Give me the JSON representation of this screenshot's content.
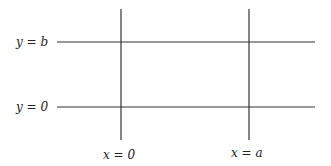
{
  "diagram": {
    "type": "grid-lines",
    "horizontal_lines": [
      {
        "label": "y = b",
        "y_px": 42,
        "x1": 57,
        "x2": 315
      },
      {
        "label": "y = 0",
        "y_px": 107,
        "x1": 57,
        "x2": 315
      }
    ],
    "vertical_lines": [
      {
        "label": "x = 0",
        "x_px": 121,
        "y1": 9,
        "y2": 140
      },
      {
        "label": "x = a",
        "x_px": 249,
        "y1": 9,
        "y2": 140
      }
    ],
    "line_color": "#333333"
  },
  "labels": {
    "y_b": "y = b",
    "y_0": "y = 0",
    "x_0": "x = 0",
    "x_a": "x = a"
  }
}
